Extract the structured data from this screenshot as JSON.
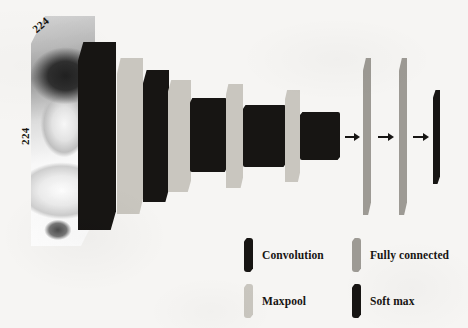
{
  "figure": {
    "type": "cnn-architecture-diagram",
    "background_color": "#f6f5f3"
  },
  "input": {
    "name": "input-image",
    "description": "grayscale photograph of a smiling child",
    "width_label": "224",
    "height_label": "224",
    "width_label_name": "input-width-224",
    "height_label_name": "input-height-224"
  },
  "colors": {
    "convolution": "#171513",
    "maxpool": "#c9c6bf",
    "fully_connected": "#9d9a94",
    "soft_max": "#171513",
    "arrow": "#171513",
    "text": "#171412"
  },
  "layers": [
    {
      "id": "conv1",
      "kind": "Convolution",
      "color": "#171513",
      "shape": "plate",
      "left": 78,
      "top": 42,
      "width": 38,
      "height": 188
    },
    {
      "id": "pool1",
      "kind": "Maxpool",
      "color": "#c9c6bf",
      "shape": "plate",
      "left": 117,
      "top": 58,
      "width": 26,
      "height": 156
    },
    {
      "id": "conv2",
      "kind": "Convolution",
      "color": "#171513",
      "shape": "plate",
      "left": 143,
      "top": 70,
      "width": 26,
      "height": 132
    },
    {
      "id": "pool2",
      "kind": "Maxpool",
      "color": "#c9c6bf",
      "shape": "plate",
      "left": 168,
      "top": 80,
      "width": 23,
      "height": 112
    },
    {
      "id": "conv3",
      "kind": "Convolution",
      "color": "#171513",
      "shape": "block",
      "left": 190,
      "top": 98,
      "width": 37,
      "height": 74
    },
    {
      "id": "pool3",
      "kind": "Maxpool",
      "color": "#c9c6bf",
      "shape": "plate",
      "left": 226,
      "top": 84,
      "width": 17,
      "height": 104
    },
    {
      "id": "conv4",
      "kind": "Convolution",
      "color": "#171513",
      "shape": "block",
      "left": 243,
      "top": 105,
      "width": 43,
      "height": 62
    },
    {
      "id": "pool4",
      "kind": "Maxpool",
      "color": "#c9c6bf",
      "shape": "plate",
      "left": 285,
      "top": 90,
      "width": 15,
      "height": 92
    },
    {
      "id": "conv5",
      "kind": "Convolution",
      "color": "#171513",
      "shape": "block",
      "left": 300,
      "top": 112,
      "width": 40,
      "height": 48
    },
    {
      "id": "fc1",
      "kind": "Fully connected",
      "color": "#9d9a94",
      "shape": "bar",
      "left": 363,
      "top": 58,
      "width": 8,
      "height": 157
    },
    {
      "id": "fc2",
      "kind": "Fully connected",
      "color": "#9d9a94",
      "shape": "bar",
      "left": 399,
      "top": 58,
      "width": 8,
      "height": 157
    },
    {
      "id": "softmax",
      "kind": "Soft max",
      "color": "#171513",
      "shape": "bar",
      "left": 433,
      "top": 90,
      "width": 7,
      "height": 94
    }
  ],
  "arrows": [
    {
      "id": "arrow-conv5-fc1",
      "left": 345,
      "top": 132,
      "width": 15
    },
    {
      "id": "arrow-fc1-fc2",
      "left": 378,
      "top": 132,
      "width": 16
    },
    {
      "id": "arrow-fc2-soft",
      "left": 413,
      "top": 132,
      "width": 16
    }
  ],
  "legend": {
    "items": [
      {
        "label": "Convolution",
        "color": "#171513"
      },
      {
        "label": "Maxpool",
        "color": "#c9c6bf"
      },
      {
        "label": "Fully connected",
        "color": "#9d9a94"
      },
      {
        "label": "Soft max",
        "color": "#171513"
      }
    ]
  }
}
